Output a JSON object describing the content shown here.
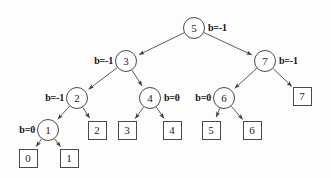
{
  "figure": {
    "background_color": "#fdfdfd",
    "stroke_color": "#4a4a4a",
    "text_color": "#1a1a1a",
    "width": 331,
    "height": 178
  },
  "internal_nodes": [
    {
      "id": "node-5",
      "label": "5",
      "x": 194,
      "y": 28,
      "balance": "b=-1",
      "balance_side": "right",
      "balance_x": 208,
      "balance_y": 22
    },
    {
      "id": "node-3",
      "label": "3",
      "x": 126,
      "y": 61,
      "balance": "b=-1",
      "balance_side": "left",
      "balance_x": 113,
      "balance_y": 55
    },
    {
      "id": "node-7",
      "label": "7",
      "x": 265,
      "y": 61,
      "balance": "b=-1",
      "balance_side": "right",
      "balance_x": 279,
      "balance_y": 55
    },
    {
      "id": "node-2",
      "label": "2",
      "x": 77,
      "y": 98,
      "balance": "b=-1",
      "balance_side": "left",
      "balance_x": 64,
      "balance_y": 92
    },
    {
      "id": "node-4",
      "label": "4",
      "x": 150,
      "y": 98,
      "balance": "b=0",
      "balance_side": "right",
      "balance_x": 164,
      "balance_y": 92
    },
    {
      "id": "node-6",
      "label": "6",
      "x": 224,
      "y": 98,
      "balance": "b=0",
      "balance_side": "left",
      "balance_x": 211,
      "balance_y": 92
    },
    {
      "id": "node-1",
      "label": "1",
      "x": 48,
      "y": 130,
      "balance": "b=0",
      "balance_side": "left",
      "balance_x": 35,
      "balance_y": 124
    }
  ],
  "leaf_nodes": [
    {
      "id": "leaf-7",
      "label": "7",
      "x": 302,
      "y": 96
    },
    {
      "id": "leaf-2",
      "label": "2",
      "x": 97,
      "y": 130
    },
    {
      "id": "leaf-3",
      "label": "3",
      "x": 127,
      "y": 130
    },
    {
      "id": "leaf-4",
      "label": "4",
      "x": 172,
      "y": 130
    },
    {
      "id": "leaf-5",
      "label": "5",
      "x": 211,
      "y": 130
    },
    {
      "id": "leaf-6",
      "label": "6",
      "x": 252,
      "y": 130
    },
    {
      "id": "leaf-0",
      "label": "0",
      "x": 28,
      "y": 158
    },
    {
      "id": "leaf-1",
      "label": "1",
      "x": 69,
      "y": 158
    }
  ],
  "edges": [
    {
      "id": "edge-5-3",
      "from": "node-5",
      "to": "node-3",
      "x1": 194,
      "y1": 28,
      "x2": 126,
      "y2": 61
    },
    {
      "id": "edge-5-7",
      "from": "node-5",
      "to": "node-7",
      "x1": 194,
      "y1": 28,
      "x2": 265,
      "y2": 61
    },
    {
      "id": "edge-3-2",
      "from": "node-3",
      "to": "node-2",
      "x1": 126,
      "y1": 61,
      "x2": 77,
      "y2": 98
    },
    {
      "id": "edge-3-4",
      "from": "node-3",
      "to": "node-4",
      "x1": 126,
      "y1": 61,
      "x2": 150,
      "y2": 98
    },
    {
      "id": "edge-7-6",
      "from": "node-7",
      "to": "node-6",
      "x1": 265,
      "y1": 61,
      "x2": 224,
      "y2": 98
    },
    {
      "id": "edge-7-leaf7",
      "from": "node-7",
      "to": "leaf-7",
      "x1": 265,
      "y1": 61,
      "x2": 302,
      "y2": 96
    },
    {
      "id": "edge-2-1",
      "from": "node-2",
      "to": "node-1",
      "x1": 77,
      "y1": 98,
      "x2": 48,
      "y2": 130
    },
    {
      "id": "edge-2-leaf2",
      "from": "node-2",
      "to": "leaf-2",
      "x1": 77,
      "y1": 98,
      "x2": 97,
      "y2": 130
    },
    {
      "id": "edge-4-leaf3",
      "from": "node-4",
      "to": "leaf-3",
      "x1": 150,
      "y1": 98,
      "x2": 127,
      "y2": 130
    },
    {
      "id": "edge-4-leaf4",
      "from": "node-4",
      "to": "leaf-4",
      "x1": 150,
      "y1": 98,
      "x2": 172,
      "y2": 130
    },
    {
      "id": "edge-6-leaf5",
      "from": "node-6",
      "to": "leaf-5",
      "x1": 224,
      "y1": 98,
      "x2": 211,
      "y2": 130
    },
    {
      "id": "edge-6-leaf6",
      "from": "node-6",
      "to": "leaf-6",
      "x1": 224,
      "y1": 98,
      "x2": 252,
      "y2": 130
    },
    {
      "id": "edge-1-leaf0",
      "from": "node-1",
      "to": "leaf-0",
      "x1": 48,
      "y1": 130,
      "x2": 28,
      "y2": 158
    },
    {
      "id": "edge-1-leaf1",
      "from": "node-1",
      "to": "leaf-1",
      "x1": 48,
      "y1": 130,
      "x2": 69,
      "y2": 158
    }
  ]
}
